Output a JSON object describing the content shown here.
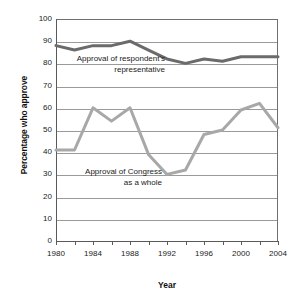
{
  "chart_data": {
    "type": "line",
    "title": "",
    "xlabel": "Year",
    "ylabel": "Percentage who approve",
    "xlim": [
      1980,
      2004
    ],
    "ylim": [
      0,
      100
    ],
    "grid": true,
    "legend_position": "inline-annotations",
    "x": [
      1980,
      1982,
      1984,
      1986,
      1988,
      1990,
      1992,
      1994,
      1996,
      1998,
      2000,
      2002,
      2004
    ],
    "x_tick_labels": [
      "1980",
      "1984",
      "1988",
      "1992",
      "1996",
      "2000",
      "2004"
    ],
    "x_tick_values": [
      1980,
      1984,
      1988,
      1992,
      1996,
      2000,
      2004
    ],
    "x_minor_tick_values": [
      1980,
      1982,
      1984,
      1986,
      1988,
      1990,
      1992,
      1994,
      1996,
      1998,
      2000,
      2002,
      2004
    ],
    "y_tick_labels": [
      "0",
      "10",
      "20",
      "30",
      "40",
      "50",
      "60",
      "70",
      "80",
      "90",
      "100"
    ],
    "y_tick_values": [
      0,
      10,
      20,
      30,
      40,
      50,
      60,
      70,
      80,
      90,
      100
    ],
    "series": [
      {
        "name": "Approval of respondent's representative",
        "color": "#6b6b6b",
        "width": 3,
        "values": [
          88,
          86,
          88,
          88,
          90,
          86,
          82,
          80,
          82,
          81,
          83,
          83,
          83
        ]
      },
      {
        "name": "Approval of Congress as a whole",
        "color": "#a8a8a8",
        "width": 3,
        "values": [
          41,
          41,
          60,
          54,
          60,
          39,
          30,
          32,
          48,
          50,
          59,
          62,
          51
        ]
      }
    ],
    "annotations": [
      {
        "id": "representative",
        "line1": "Approval of respondent's",
        "line2": "representative"
      },
      {
        "id": "congress",
        "line1": "Approval of Congress",
        "line2": "as a whole"
      }
    ]
  },
  "colors": {
    "series_representative": "#6b6b6b",
    "series_congress": "#a8a8a8",
    "gridline": "#9a9a9a",
    "axis": "#5a5a5a",
    "background": "#ffffff",
    "text": "#1a1a1a"
  }
}
